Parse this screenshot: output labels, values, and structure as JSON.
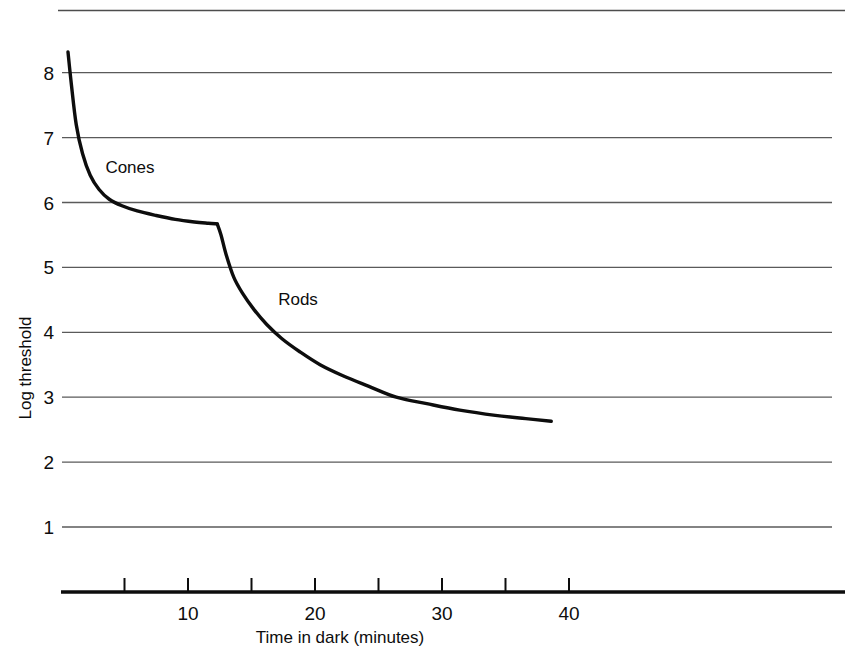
{
  "chart_data": {
    "type": "line",
    "title": "",
    "xlabel": "Time in dark  (minutes)",
    "ylabel": "Log threshold",
    "xlim": [
      0,
      62
    ],
    "ylim": [
      0.4,
      8.6
    ],
    "grid": true,
    "legend": "none",
    "xticks": [
      5,
      10,
      15,
      20,
      25,
      30,
      35,
      40
    ],
    "xtick_labels": [
      "",
      "10",
      "",
      "20",
      "",
      "30",
      "",
      "40"
    ],
    "yticks": [
      1,
      2,
      3,
      4,
      5,
      6,
      7,
      8
    ],
    "ytick_labels": [
      "1",
      "2",
      "3",
      "4",
      "5",
      "6",
      "7",
      "8"
    ],
    "annotations": [
      {
        "text": "Cones",
        "x": 3.5,
        "y": 6.45
      },
      {
        "text": "Rods",
        "x": 17.1,
        "y": 4.42
      }
    ],
    "series": [
      {
        "name": "Cones",
        "x": [
          0.55,
          0.8,
          1.2,
          1.7,
          2.3,
          3.0,
          3.8,
          4.8,
          6.0,
          7.5,
          9.0,
          10.5,
          11.6,
          12.3
        ],
        "y": [
          8.32,
          7.85,
          7.2,
          6.75,
          6.42,
          6.2,
          6.05,
          5.95,
          5.87,
          5.8,
          5.74,
          5.7,
          5.68,
          5.67
        ]
      },
      {
        "name": "Rods",
        "x": [
          12.3,
          12.6,
          13.0,
          13.6,
          14.3,
          15.2,
          16.2,
          17.4,
          18.8,
          20.4,
          22.2,
          24.2,
          26.4,
          28.8,
          31.4,
          34.2,
          36.6,
          38.6
        ],
        "y": [
          5.67,
          5.5,
          5.2,
          4.85,
          4.6,
          4.35,
          4.12,
          3.9,
          3.7,
          3.5,
          3.33,
          3.17,
          3.0,
          2.9,
          2.8,
          2.72,
          2.67,
          2.63
        ]
      }
    ],
    "colors": {
      "curve": "#0d0d0d",
      "grid": "#5a5a5a",
      "axis": "#0d0d0d",
      "text": "#0d0d0d",
      "background": "#ffffff"
    },
    "top_rule": true
  }
}
